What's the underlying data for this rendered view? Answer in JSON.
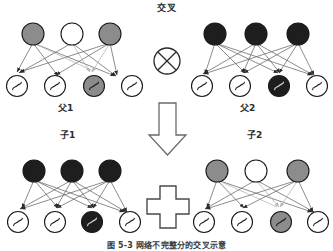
{
  "figure": {
    "title": "交叉",
    "caption": "图 5-3  网络不完整分的交叉示意",
    "operators": {
      "crossover_symbol": "circled-times-operator",
      "arrow_symbol": "down-block-arrow",
      "plus_symbol": "plus-block-shape"
    },
    "colors": {
      "node_gray": "#8c8c8c",
      "node_black": "#1e1e1e",
      "node_white": "#ffffff",
      "stroke": "#1a1a1a",
      "edge_dark": "#4a4a4a",
      "edge_light": "#b5b5b5",
      "text": "#2b2b2b"
    }
  },
  "networks": [
    {
      "id": "parent1",
      "label": "父1",
      "role": "parent",
      "hidden_layer": [
        {
          "index": 0,
          "fill": "gray"
        },
        {
          "index": 1,
          "fill": "white"
        },
        {
          "index": 2,
          "fill": "gray"
        }
      ],
      "output_layer": [
        {
          "index": 0,
          "fill": "white",
          "glyph": "sigmoid"
        },
        {
          "index": 1,
          "fill": "white",
          "glyph": "sigmoid"
        },
        {
          "index": 2,
          "fill": "gray",
          "glyph": "sigmoid"
        },
        {
          "index": 3,
          "fill": "white",
          "glyph": "sigmoid"
        }
      ]
    },
    {
      "id": "parent2",
      "label": "父2",
      "role": "parent",
      "hidden_layer": [
        {
          "index": 0,
          "fill": "black"
        },
        {
          "index": 1,
          "fill": "black"
        },
        {
          "index": 2,
          "fill": "black"
        }
      ],
      "output_layer": [
        {
          "index": 0,
          "fill": "white",
          "glyph": "sigmoid"
        },
        {
          "index": 1,
          "fill": "white",
          "glyph": "sigmoid"
        },
        {
          "index": 2,
          "fill": "black",
          "glyph": "sigmoid"
        },
        {
          "index": 3,
          "fill": "white",
          "glyph": "sigmoid"
        }
      ]
    },
    {
      "id": "child1",
      "label": "子1",
      "role": "child",
      "hidden_layer": [
        {
          "index": 0,
          "fill": "black"
        },
        {
          "index": 1,
          "fill": "black"
        },
        {
          "index": 2,
          "fill": "black"
        }
      ],
      "output_layer": [
        {
          "index": 0,
          "fill": "white",
          "glyph": "sigmoid"
        },
        {
          "index": 1,
          "fill": "white",
          "glyph": "sigmoid"
        },
        {
          "index": 2,
          "fill": "black",
          "glyph": "sigmoid"
        },
        {
          "index": 3,
          "fill": "white",
          "glyph": "sigmoid"
        }
      ]
    },
    {
      "id": "child2",
      "label": "子2",
      "role": "child",
      "hidden_layer": [
        {
          "index": 0,
          "fill": "gray"
        },
        {
          "index": 1,
          "fill": "white"
        },
        {
          "index": 2,
          "fill": "gray"
        }
      ],
      "output_layer": [
        {
          "index": 0,
          "fill": "white",
          "glyph": "sigmoid"
        },
        {
          "index": 1,
          "fill": "white",
          "glyph": "sigmoid"
        },
        {
          "index": 2,
          "fill": "gray",
          "glyph": "sigmoid"
        },
        {
          "index": 3,
          "fill": "white",
          "glyph": "sigmoid"
        }
      ]
    }
  ]
}
